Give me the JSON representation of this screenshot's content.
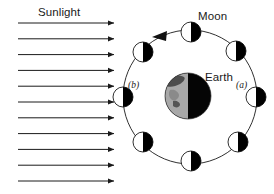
{
  "figure": {
    "title_text": "",
    "type": "astronomy-diagram",
    "background_color": "#ffffff",
    "line_color": "#1a1a1a",
    "lit_color": "#ffffff",
    "dark_color": "#000000",
    "earth_lit_color": "#a8a8a8",
    "earth_dark_color": "#050505",
    "earth_land_color": "#4d4d4d"
  },
  "labels": {
    "sunlight": "Sunlight",
    "moon": "Moon",
    "earth": "Earth",
    "position_a": "(a)",
    "position_b": "(b)"
  },
  "sunlight_rays": {
    "count": 11,
    "x_start": 18,
    "x_end": 118,
    "y_first": 23,
    "y_spacing": 15.8,
    "direction": "left-to-right",
    "arrowhead": "filled-triangle"
  },
  "orbit": {
    "center_x": 190,
    "center_y": 97,
    "radius": 67,
    "direction_label": "counter-clockwise",
    "direction_arrow_angle_deg": 115
  },
  "earth": {
    "center_x": 188,
    "center_y": 96,
    "radius": 23,
    "lit_side": "left",
    "dark_side": "right"
  },
  "moons": [
    {
      "id": "moon-top",
      "angle_deg": 90,
      "cx": 191,
      "cy": 32,
      "r": 10,
      "lit_side": "left",
      "phase": "new-moon-view"
    },
    {
      "id": "moon-upper-right",
      "angle_deg": 45,
      "cx": 236,
      "cy": 51,
      "r": 10,
      "lit_side": "left",
      "phase": "waning-crescent-view"
    },
    {
      "id": "moon-right-a",
      "angle_deg": 0,
      "cx": 256,
      "cy": 97,
      "r": 10,
      "lit_side": "left",
      "phase": "full-moon-view"
    },
    {
      "id": "moon-lower-right",
      "angle_deg": 315,
      "cx": 238,
      "cy": 142,
      "r": 10,
      "lit_side": "left",
      "phase": "waxing-gibbous-view"
    },
    {
      "id": "moon-bottom",
      "angle_deg": 270,
      "cx": 191,
      "cy": 161,
      "r": 10,
      "lit_side": "left",
      "phase": "first-quarter-view"
    },
    {
      "id": "moon-lower-left",
      "angle_deg": 225,
      "cx": 143,
      "cy": 142,
      "r": 10,
      "lit_side": "left",
      "phase": "waxing-crescent-view"
    },
    {
      "id": "moon-left-b",
      "angle_deg": 180,
      "cx": 123,
      "cy": 97,
      "r": 10,
      "lit_side": "left",
      "phase": "new-moon-view"
    },
    {
      "id": "moon-upper-left",
      "angle_deg": 135,
      "cx": 143,
      "cy": 52,
      "r": 10,
      "lit_side": "left",
      "phase": "waning-crescent-view"
    }
  ]
}
